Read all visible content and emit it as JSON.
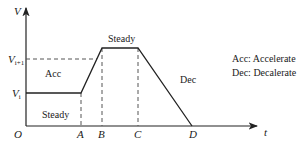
{
  "axes": {
    "y_label": "V",
    "x_label": "t",
    "origin_label": "O"
  },
  "y_ticks": {
    "v_i": {
      "base": "V",
      "sub": "i"
    },
    "v_i1": {
      "base": "V",
      "sub": "i+1"
    }
  },
  "x_ticks": [
    "A",
    "B",
    "C",
    "D"
  ],
  "regions": {
    "steady_low": "Steady",
    "acc": "Acc",
    "steady_high": "Steady",
    "dec": "Dec"
  },
  "legend": {
    "acc": "Acc: Accelerate",
    "dec": "Dec: Decalerate"
  },
  "colors": {
    "line": "#222222",
    "dashed": "#555555",
    "background": "#ffffff"
  }
}
